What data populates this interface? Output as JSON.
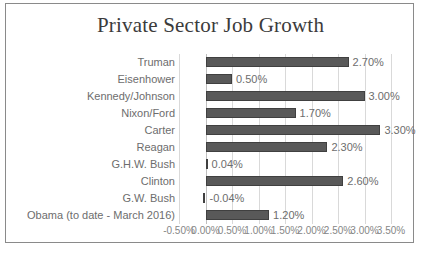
{
  "chart_data": {
    "type": "bar",
    "orientation": "horizontal",
    "title": "Private Sector Job Growth",
    "xlabel": "",
    "ylabel": "",
    "categories": [
      "Truman",
      "Eisenhower",
      "Kennedy/Johnson",
      "Nixon/Ford",
      "Carter",
      "Reagan",
      "G.H.W. Bush",
      "Clinton",
      "G.W. Bush",
      "Obama (to date - March 2016)"
    ],
    "values": [
      2.7,
      0.5,
      3.0,
      1.7,
      3.3,
      2.3,
      0.04,
      2.6,
      -0.04,
      1.2
    ],
    "data_labels": [
      "2.70%",
      "0.50%",
      "3.00%",
      "1.70%",
      "3.30%",
      "2.30%",
      "0.04%",
      "2.60%",
      "-0.04%",
      "1.20%"
    ],
    "xlim": [
      -0.5,
      3.5
    ],
    "xticks": [
      -0.5,
      0.0,
      0.5,
      1.0,
      1.5,
      2.0,
      2.5,
      3.0,
      3.5
    ],
    "xtick_labels": [
      "-0.50%",
      "0.00%",
      "0.50%",
      "1.00%",
      "1.50%",
      "2.00%",
      "2.50%",
      "3.00%",
      "3.50%"
    ],
    "grid": true,
    "legend": false,
    "bar_color": "#595959",
    "gridline_color": "#d9d9d9",
    "label_color": "#6d6d6d"
  }
}
